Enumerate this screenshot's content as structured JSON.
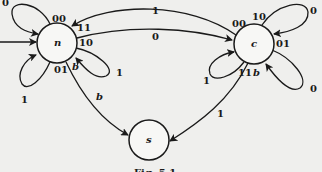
{
  "diagram": {
    "type": "state-transition-diagram",
    "states": [
      {
        "id": "n",
        "label": "n",
        "initial": true
      },
      {
        "id": "c",
        "label": "c"
      },
      {
        "id": "s",
        "label": "s"
      }
    ],
    "labels": {
      "n_loop_top_input": "0",
      "n_loop_top_state": "00",
      "n_to_c_from": "11",
      "n_to_c_input": "0",
      "c_to_n_input": "1",
      "c_to_n_from": "00",
      "n_loop_right_state": "10",
      "n_loop_right_input": "1",
      "n_loop_right_b": "b",
      "n_loop_left_state": "01",
      "n_loop_left_input": "1",
      "n_to_s_input": "b",
      "c_loop_top_state": "10",
      "c_loop_top_input": "0",
      "c_loop_right_state": "01",
      "c_loop_right_input": "0",
      "c_loop_right_b": "b",
      "c_loop_left_state": "11",
      "c_loop_left_input": "1",
      "c_to_s_input": "1"
    },
    "caption": "Fig. 5.1"
  }
}
